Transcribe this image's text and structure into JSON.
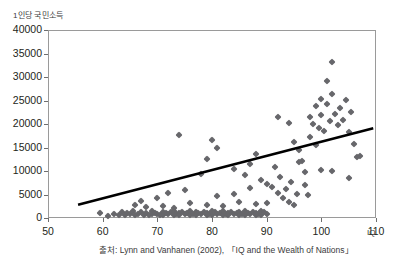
{
  "chart_data": {
    "type": "scatter",
    "title": "",
    "ylabel": "1인당 국민소득",
    "xlabel": "IQ",
    "xlabel_unit": "IQ",
    "xlim": [
      50,
      110
    ],
    "ylim": [
      0,
      40000
    ],
    "xticks": [
      50,
      60,
      70,
      80,
      90,
      100,
      110
    ],
    "yticks": [
      0,
      5000,
      10000,
      15000,
      20000,
      25000,
      30000,
      35000,
      40000
    ],
    "grid": "horizontal",
    "legend": "none",
    "marker": "diamond",
    "marker_color": "#67676b",
    "trendline": {
      "type": "linear",
      "color": "#000000",
      "x_start": 55.5,
      "y_start": 2800,
      "x_end": 109.5,
      "y_end": 19100
    },
    "points": [
      [
        59.5,
        1000
      ],
      [
        61.0,
        500
      ],
      [
        62.0,
        900
      ],
      [
        63.0,
        700
      ],
      [
        63.5,
        1300
      ],
      [
        64.0,
        600
      ],
      [
        64.5,
        1100
      ],
      [
        65.0,
        800
      ],
      [
        65.5,
        1500
      ],
      [
        66.0,
        700
      ],
      [
        66.5,
        900
      ],
      [
        67.0,
        1200
      ],
      [
        67.0,
        3600
      ],
      [
        67.5,
        700
      ],
      [
        68.0,
        1000
      ],
      [
        68.5,
        600
      ],
      [
        69.0,
        1400
      ],
      [
        69.0,
        800
      ],
      [
        69.5,
        1100
      ],
      [
        70.0,
        900
      ],
      [
        70.0,
        4200
      ],
      [
        70.5,
        700
      ],
      [
        71.0,
        1300
      ],
      [
        71.0,
        600
      ],
      [
        71.5,
        1000
      ],
      [
        72.0,
        800
      ],
      [
        72.0,
        5300
      ],
      [
        72.5,
        1200
      ],
      [
        73.0,
        700
      ],
      [
        73.0,
        1500
      ],
      [
        73.5,
        900
      ],
      [
        74.0,
        1100
      ],
      [
        74.0,
        600
      ],
      [
        74.5,
        1300
      ],
      [
        75.0,
        800
      ],
      [
        75.0,
        5900
      ],
      [
        75.5,
        1000
      ],
      [
        76.0,
        700
      ],
      [
        76.0,
        1400
      ],
      [
        76.5,
        900
      ],
      [
        77.0,
        1200
      ],
      [
        77.0,
        600
      ],
      [
        77.5,
        1000
      ],
      [
        78.0,
        800
      ],
      [
        78.0,
        9300
      ],
      [
        78.5,
        1300
      ],
      [
        79.0,
        700
      ],
      [
        79.0,
        1100
      ],
      [
        79.5,
        900
      ],
      [
        80.0,
        1500
      ],
      [
        80.0,
        600
      ],
      [
        80.5,
        1200
      ],
      [
        81.0,
        800
      ],
      [
        81.0,
        4600
      ],
      [
        81.5,
        1000
      ],
      [
        82.0,
        1400
      ],
      [
        82.0,
        700
      ],
      [
        82.5,
        900
      ],
      [
        83.0,
        1100
      ],
      [
        83.0,
        600
      ],
      [
        83.5,
        1300
      ],
      [
        84.0,
        800
      ],
      [
        84.0,
        5100
      ],
      [
        84.5,
        1000
      ],
      [
        85.0,
        700
      ],
      [
        85.0,
        1200
      ],
      [
        85.5,
        900
      ],
      [
        86.0,
        1500
      ],
      [
        86.0,
        600
      ],
      [
        86.5,
        1100
      ],
      [
        87.0,
        800
      ],
      [
        87.0,
        6400
      ],
      [
        87.5,
        1300
      ],
      [
        88.0,
        700
      ],
      [
        88.0,
        1000
      ],
      [
        88.5,
        900
      ],
      [
        89.0,
        1400
      ],
      [
        89.0,
        600
      ],
      [
        89.5,
        1200
      ],
      [
        90.0,
        800
      ],
      [
        66.0,
        2800
      ],
      [
        68.0,
        2400
      ],
      [
        71.0,
        2600
      ],
      [
        73.0,
        2200
      ],
      [
        76.0,
        3100
      ],
      [
        79.0,
        2700
      ],
      [
        82.0,
        2500
      ],
      [
        85.0,
        3300
      ],
      [
        88.0,
        2900
      ],
      [
        90.0,
        3200
      ],
      [
        74.0,
        17700
      ],
      [
        79.0,
        12500
      ],
      [
        80.0,
        16600
      ],
      [
        81.0,
        14900
      ],
      [
        84.0,
        10400
      ],
      [
        86.0,
        9200
      ],
      [
        87.0,
        11500
      ],
      [
        88.0,
        13700
      ],
      [
        89.0,
        8100
      ],
      [
        90.0,
        7300
      ],
      [
        91.0,
        6600
      ],
      [
        91.5,
        10900
      ],
      [
        92.0,
        5400
      ],
      [
        92.5,
        8800
      ],
      [
        93.0,
        4200
      ],
      [
        93.5,
        6100
      ],
      [
        94.0,
        3500
      ],
      [
        94.5,
        7600
      ],
      [
        95.0,
        2700
      ],
      [
        95.5,
        5100
      ],
      [
        96.0,
        14400
      ],
      [
        96.5,
        12100
      ],
      [
        97.0,
        9700
      ],
      [
        97.5,
        4800
      ],
      [
        98.0,
        21500
      ],
      [
        98.0,
        17300
      ],
      [
        98.5,
        20100
      ],
      [
        99.0,
        23900
      ],
      [
        99.0,
        15600
      ],
      [
        99.5,
        19200
      ],
      [
        100.0,
        25300
      ],
      [
        100.0,
        21900
      ],
      [
        100.5,
        18500
      ],
      [
        101.0,
        29100
      ],
      [
        101.0,
        24200
      ],
      [
        101.5,
        20600
      ],
      [
        102.0,
        33100
      ],
      [
        102.0,
        26400
      ],
      [
        102.5,
        22100
      ],
      [
        103.0,
        19800
      ],
      [
        103.5,
        23400
      ],
      [
        104.0,
        20900
      ],
      [
        104.5,
        25100
      ],
      [
        105.0,
        18200
      ],
      [
        105.5,
        22600
      ],
      [
        106.0,
        15800
      ],
      [
        106.5,
        12900
      ],
      [
        107.0,
        13200
      ],
      [
        92.0,
        21400
      ],
      [
        94.0,
        20300
      ],
      [
        95.0,
        16100
      ],
      [
        96.0,
        11900
      ],
      [
        97.0,
        7100
      ],
      [
        100.0,
        10200
      ],
      [
        102.0,
        9900
      ],
      [
        105.0,
        8600
      ]
    ]
  },
  "source": {
    "text": "출처: Lynn and Vanhanen (2002), 「IQ and the Wealth of Nations」"
  }
}
